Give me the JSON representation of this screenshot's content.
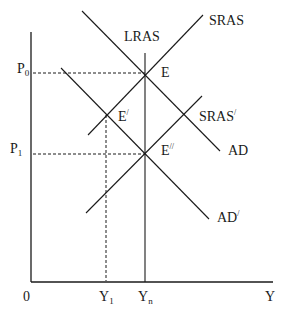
{
  "diagram": {
    "type": "AD-AS macroeconomic diagram",
    "axes": {
      "x_label": "Y",
      "origin_label": "0",
      "x_ticks": [
        {
          "base": "Y",
          "sub": "1"
        },
        {
          "base": "Y",
          "sub": "n"
        }
      ],
      "y_ticks": [
        {
          "base": "P",
          "sub": "0"
        },
        {
          "base": "P",
          "sub": "1"
        }
      ]
    },
    "curves": {
      "lras": {
        "label": "LRAS"
      },
      "sras": {
        "label": "SRAS"
      },
      "sras_prime": {
        "base": "SRAS",
        "prime": "/"
      },
      "ad": {
        "label": "AD"
      },
      "ad_prime": {
        "base": "AD",
        "prime": "/"
      }
    },
    "points": {
      "e": {
        "label": "E"
      },
      "e_prime": {
        "base": "E",
        "prime": "/"
      },
      "e_double_prime": {
        "base": "E",
        "prime": "//"
      }
    }
  }
}
